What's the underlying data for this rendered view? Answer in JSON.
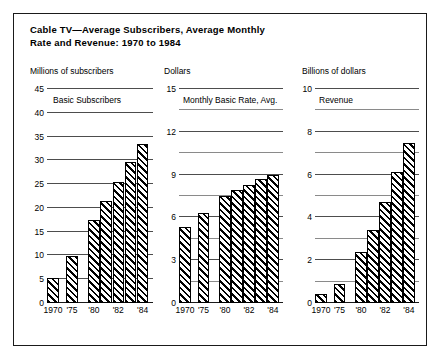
{
  "title": "Cable TV—Average Subscribers, Average Monthly\nRate and Revenue: 1970 to 1984",
  "chart_data": [
    {
      "type": "bar",
      "title": "Basic Subscribers",
      "ylabel": "Millions of subscribers",
      "xlabel": "",
      "categories": [
        "1970",
        "'75",
        "'80",
        "'81",
        "'82",
        "'83",
        "'84"
      ],
      "tick_labels": [
        "1970",
        "'75",
        "'80",
        "",
        "'82",
        "",
        "'84"
      ],
      "values": [
        5.3,
        9.8,
        17.5,
        21.5,
        25.5,
        29.7,
        33.5
      ],
      "ylim": [
        0,
        45
      ],
      "yticks": [
        0,
        5,
        10,
        15,
        20,
        25,
        30,
        35,
        40,
        45
      ],
      "ytick_labels": [
        "0",
        "5",
        "10",
        "15",
        "20",
        "25",
        "30",
        "35",
        "40",
        "45"
      ],
      "minor_yticks": [],
      "grid": true,
      "legend": "none"
    },
    {
      "type": "bar",
      "title": "Monthly Basic Rate, Avg.",
      "ylabel": "Dollars",
      "xlabel": "",
      "categories": [
        "1970",
        "'75",
        "'80",
        "'81",
        "'82",
        "'83",
        "'84"
      ],
      "tick_labels": [
        "1970",
        "'75",
        "'80",
        "",
        "'82",
        "",
        "'84"
      ],
      "values": [
        5.3,
        6.3,
        7.5,
        7.9,
        8.3,
        8.7,
        9.0
      ],
      "ylim": [
        0,
        15
      ],
      "yticks": [
        0,
        3,
        6,
        9,
        12,
        15
      ],
      "ytick_labels": [
        "0",
        "3",
        "6",
        "9",
        "12",
        "15"
      ],
      "minor_yticks": [
        1.5,
        4.5,
        7.5,
        10.5,
        13.5
      ],
      "grid": true,
      "legend": "none"
    },
    {
      "type": "bar",
      "title": "Revenue",
      "ylabel": "Billions of dollars",
      "xlabel": "",
      "categories": [
        "1970",
        "'75",
        "'80",
        "'81",
        "'82",
        "'83",
        "'84"
      ],
      "tick_labels": [
        "1970",
        "'75",
        "'80",
        "",
        "'82",
        "",
        "'84"
      ],
      "values": [
        0.4,
        0.9,
        2.4,
        3.4,
        4.7,
        6.1,
        7.5
      ],
      "ylim": [
        0,
        10
      ],
      "yticks": [
        0,
        2,
        4,
        6,
        8,
        10
      ],
      "ytick_labels": [
        "0",
        "2",
        "4",
        "6",
        "8",
        "10"
      ],
      "minor_yticks": [
        1,
        3,
        5,
        7,
        9
      ],
      "grid": true,
      "legend": "none"
    }
  ],
  "colors": {
    "background": "#ffffff",
    "ink": "#000000",
    "gridline": "#4d4d4d",
    "gridline_minor": "#8a8a8a",
    "frame": "#1a1a1a"
  }
}
